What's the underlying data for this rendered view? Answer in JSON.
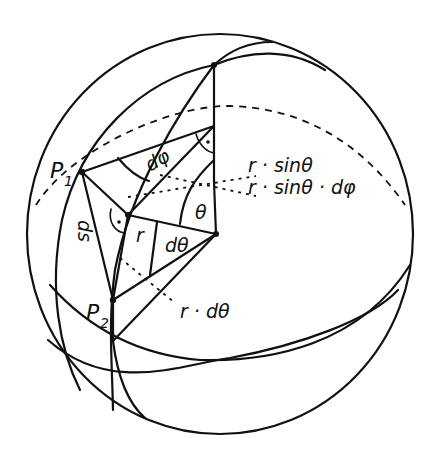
{
  "figure": {
    "labels": {
      "p1": "P",
      "p1_sub": "1",
      "p2": "P",
      "p2_sub": "2",
      "ds": "ds",
      "r": "r",
      "theta": "θ",
      "dtheta": "dθ",
      "dphi": "dφ",
      "r_sin_theta": "r · sinθ",
      "r_sin_theta_dphi": "r · sinθ · dφ",
      "r_dtheta": "r · dθ"
    },
    "colors": {
      "ink": "#111111",
      "paper": "#ffffff"
    }
  }
}
